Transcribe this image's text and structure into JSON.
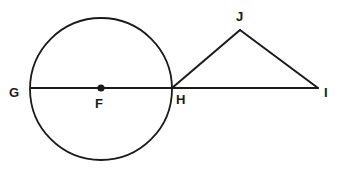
{
  "figure": {
    "width": 342,
    "height": 172,
    "background_color": "#ffffff",
    "stroke_color": "#1a1a1a",
    "label_color": "#1a1a1a"
  },
  "labels": {
    "g": "G",
    "f": "F",
    "h": "H",
    "j": "J",
    "i": "I"
  },
  "geometry": {
    "circle": {
      "center_label": "F",
      "cx": 101,
      "cy": 89,
      "r": 71,
      "stroke_width": 1.8
    },
    "center_dot": {
      "cx": 101,
      "cy": 88,
      "r": 3.6
    },
    "points": {
      "G": {
        "x": 31,
        "y": 88
      },
      "F": {
        "x": 101,
        "y": 88
      },
      "H": {
        "x": 172,
        "y": 88
      },
      "J": {
        "x": 240,
        "y": 30
      },
      "I": {
        "x": 318,
        "y": 88
      }
    },
    "segments": [
      {
        "name": "segment-GI",
        "from": "G",
        "to": "I",
        "x1": 31,
        "y1": 88,
        "x2": 318,
        "y2": 88
      },
      {
        "name": "segment-HJ",
        "from": "H",
        "to": "J",
        "x1": 172,
        "y1": 88,
        "x2": 240,
        "y2": 30
      },
      {
        "name": "segment-JI",
        "from": "J",
        "to": "I",
        "x1": 240,
        "y1": 30,
        "x2": 318,
        "y2": 88
      }
    ]
  }
}
